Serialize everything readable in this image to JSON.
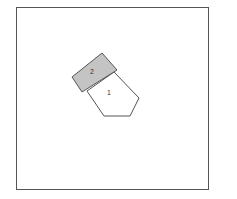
{
  "diagram": {
    "frame": {
      "x": 16,
      "y": 7,
      "width": 192,
      "height": 182,
      "stroke": "#555555"
    },
    "shapes": [
      {
        "id": "1",
        "label": "1",
        "type": "pentagon",
        "fill": "#ffffff",
        "stroke": "#555555",
        "points": "87,91 114,72 139,98 130,116 104,116",
        "label_pos": {
          "x": 109,
          "y": 95
        }
      },
      {
        "id": "2",
        "label": "2",
        "type": "rectangle",
        "fill": "#c4c4c4",
        "stroke": "#555555",
        "points": "72,77 102,53 117,70 82,92",
        "label_pos": {
          "x": 92,
          "y": 74
        }
      }
    ]
  }
}
